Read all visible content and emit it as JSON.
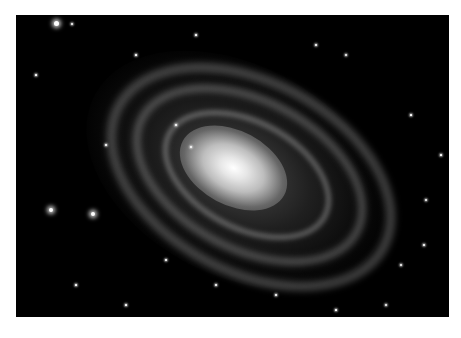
{
  "image": {
    "subject": "spiral galaxy",
    "background_color": "#000000",
    "page_background": "#ffffff"
  },
  "stars": [
    {
      "x": 40,
      "y": 8,
      "size": 5,
      "kind": "big"
    },
    {
      "x": 56,
      "y": 9,
      "size": 2,
      "kind": "mid"
    },
    {
      "x": 35,
      "y": 195,
      "size": 4,
      "kind": "big"
    },
    {
      "x": 77,
      "y": 199,
      "size": 4,
      "kind": "big"
    },
    {
      "x": 330,
      "y": 40,
      "size": 2,
      "kind": "mid"
    },
    {
      "x": 300,
      "y": 30,
      "size": 1.5,
      "kind": "mid"
    },
    {
      "x": 410,
      "y": 185,
      "size": 2,
      "kind": "mid"
    },
    {
      "x": 385,
      "y": 250,
      "size": 2,
      "kind": "mid"
    },
    {
      "x": 408,
      "y": 230,
      "size": 1.5,
      "kind": "mid"
    },
    {
      "x": 370,
      "y": 290,
      "size": 2,
      "kind": "mid"
    },
    {
      "x": 150,
      "y": 245,
      "size": 1.5,
      "kind": "mid"
    },
    {
      "x": 200,
      "y": 270,
      "size": 1.5,
      "kind": "mid"
    },
    {
      "x": 260,
      "y": 280,
      "size": 1.5,
      "kind": "mid"
    },
    {
      "x": 90,
      "y": 130,
      "size": 1.5,
      "kind": "mid"
    },
    {
      "x": 20,
      "y": 60,
      "size": 1.2,
      "kind": "mid"
    },
    {
      "x": 120,
      "y": 40,
      "size": 1.2,
      "kind": "mid"
    },
    {
      "x": 180,
      "y": 20,
      "size": 1.2,
      "kind": "mid"
    },
    {
      "x": 395,
      "y": 100,
      "size": 1.2,
      "kind": "mid"
    },
    {
      "x": 425,
      "y": 140,
      "size": 1.2,
      "kind": "mid"
    },
    {
      "x": 60,
      "y": 270,
      "size": 1.2,
      "kind": "mid"
    },
    {
      "x": 110,
      "y": 290,
      "size": 1.2,
      "kind": "mid"
    },
    {
      "x": 320,
      "y": 295,
      "size": 1.2,
      "kind": "mid"
    },
    {
      "x": 175,
      "y": 132,
      "size": 2,
      "kind": "mid"
    },
    {
      "x": 160,
      "y": 110,
      "size": 1.5,
      "kind": "mid"
    }
  ]
}
